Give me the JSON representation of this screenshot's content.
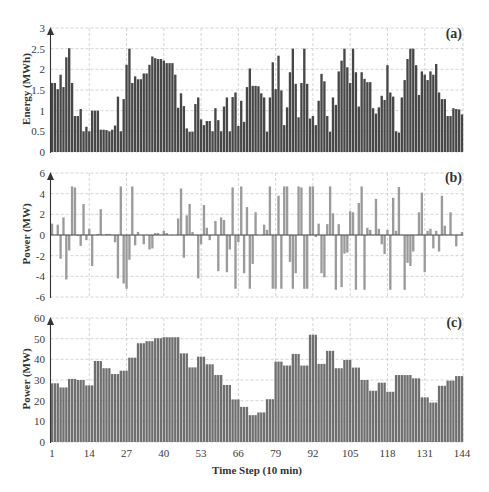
{
  "figure": {
    "x_axis_title": "Time Step (10 min)",
    "x_ticks": [
      "1",
      "14",
      "27",
      "40",
      "53",
      "66",
      "79",
      "92",
      "105",
      "118",
      "131",
      "144"
    ]
  },
  "colors": {
    "energy_bars": "#474747",
    "power_bars": "#9b9b9b",
    "load_bars": "#6f6f6f",
    "grid": "#c9c9c9",
    "axis": "#333333"
  },
  "chart_data": [
    {
      "type": "bar",
      "panel_label": "(a)",
      "title": "",
      "xlabel": "Time Step (10 min)",
      "ylabel": "Energy (MWh)",
      "x_start": 1,
      "x_end": 144,
      "x_ticks": [
        1,
        14,
        27,
        40,
        53,
        66,
        79,
        92,
        105,
        118,
        131,
        144
      ],
      "y_ticks": [
        "0",
        "0.5",
        "1",
        "1.5",
        "2",
        "2.5",
        "3"
      ],
      "ylim": [
        0,
        3
      ],
      "grid": true,
      "legend": null,
      "series": [
        {
          "name": "Energy",
          "values": [
            1.67,
            1.67,
            1.52,
            1.87,
            1.57,
            2.29,
            2.51,
            1.67,
            0.87,
            0.87,
            1.04,
            0.5,
            0.61,
            0.5,
            1.0,
            1.0,
            1.0,
            0.54,
            0.54,
            0.53,
            0.5,
            0.54,
            0.64,
            1.34,
            0.5,
            1.28,
            2.11,
            2.5,
            1.67,
            1.83,
            1.76,
            1.76,
            1.9,
            1.9,
            2.11,
            2.31,
            2.27,
            2.25,
            2.25,
            2.21,
            2.15,
            2.15,
            2.15,
            1.87,
            1.07,
            1.42,
            1.11,
            0.57,
            0.49,
            0.49,
            1.16,
            1.32,
            0.79,
            0.65,
            0.75,
            0.75,
            0.5,
            1.06,
            0.77,
            0.5,
            1.1,
            1.32,
            0.5,
            1.33,
            1.44,
            0.63,
            1.24,
            0.73,
            1.57,
            2.02,
            1.6,
            1.6,
            1.59,
            1.42,
            1.32,
            0.49,
            1.32,
            2.17,
            1.52,
            2.33,
            1.49,
            0.65,
            1.08,
            1.93,
            2.5,
            1.65,
            0.84,
            1.67,
            2.5,
            1.65,
            0.81,
            0.87,
            0.65,
            1.24,
            1.89,
            1.71,
            0.87,
            0.49,
            1.32,
            1.14,
            1.95,
            2.21,
            2.5,
            2.05,
            1.67,
            2.5,
            1.93,
            1.1,
            1.93,
            1.77,
            1.69,
            1.69,
            1.06,
            0.93,
            1.08,
            1.36,
            1.26,
            2.1,
            1.44,
            1.34,
            0.5,
            0.47,
            1.32,
            1.74,
            2.25,
            2.5,
            2.5,
            2.1,
            1.38,
            1.95,
            1.87,
            1.74,
            1.95,
            1.87,
            2.13,
            1.44,
            1.28,
            1.28,
            0.87,
            0.87,
            1.06,
            1.04,
            1.03,
            0.91
          ]
        }
      ]
    },
    {
      "type": "bar",
      "panel_label": "(b)",
      "title": "",
      "xlabel": "Time Step (10 min)",
      "ylabel": "Power (MW)",
      "x_start": 1,
      "x_end": 144,
      "x_ticks": [
        1,
        14,
        27,
        40,
        53,
        66,
        79,
        92,
        105,
        118,
        131,
        144
      ],
      "y_ticks": [
        "-6",
        "-4",
        "-2",
        "0",
        "2",
        "4",
        "6"
      ],
      "ylim": [
        -6,
        6
      ],
      "grid": true,
      "legend": null,
      "series": [
        {
          "name": "Power",
          "values": [
            1.1,
            0,
            1.0,
            -2.3,
            1.7,
            -4.3,
            -1.5,
            4.7,
            4.6,
            -0.1,
            -1.05,
            3.0,
            -0.5,
            0.6,
            -3.0,
            0,
            0.1,
            2.5,
            0,
            0.1,
            0.1,
            0,
            -0.7,
            -4.2,
            4.7,
            -4.7,
            -5.2,
            -2.4,
            4.7,
            -1.0,
            0.3,
            0,
            -0.9,
            0,
            -1.4,
            -1.3,
            0.2,
            0.2,
            0,
            0.4,
            0.2,
            0,
            0,
            0,
            1.6,
            4.5,
            -2.2,
            1.9,
            3.0,
            0.3,
            0,
            -4.2,
            -0.9,
            2.9,
            0.7,
            -0.5,
            0,
            1.35,
            -3.5,
            1.7,
            1.45,
            -3.6,
            -1.4,
            4.6,
            -5.2,
            -0.7,
            4.7,
            -3.7,
            2.7,
            -5.2,
            -2.8,
            2.2,
            0,
            0,
            1.0,
            0.5,
            4.7,
            -5.2,
            -5.2,
            3.8,
            -5.2,
            4.7,
            4.7,
            -2.6,
            -5.2,
            -3.7,
            4.7,
            4.6,
            -5.2,
            -5.2,
            4.7,
            4.7,
            -0.2,
            1.1,
            -3.7,
            -4.1,
            1.05,
            4.7,
            2.1,
            -5.3,
            1.05,
            -5.05,
            -1.8,
            -1.7,
            2.3,
            2.2,
            -5.3,
            3.1,
            4.7,
            -5.3,
            0.7,
            0.5,
            0,
            3.5,
            0.6,
            -0.9,
            -1.85,
            0.5,
            -5.3,
            3.6,
            0.4,
            4.65,
            0,
            -5.3,
            -2.7,
            -3.0,
            -1.6,
            0,
            2.2,
            4.1,
            -3.6,
            0.4,
            0.6,
            -1.3,
            0.4,
            -1.6,
            3.8,
            0.9,
            0,
            2.2,
            0,
            -1.1,
            0,
            0.3
          ]
        }
      ]
    },
    {
      "type": "bar",
      "panel_label": "(c)",
      "title": "",
      "xlabel": "Time Step (10 min)",
      "ylabel": "Power (MW)",
      "x_start": 1,
      "x_end": 144,
      "x_ticks": [
        1,
        14,
        27,
        40,
        53,
        66,
        79,
        92,
        105,
        118,
        131,
        144
      ],
      "y_ticks": [
        "0",
        "10",
        "20",
        "30",
        "40",
        "50",
        "60"
      ],
      "ylim": [
        0,
        60
      ],
      "grid": true,
      "legend": null,
      "series": [
        {
          "name": "Power",
          "values": [
            28.4,
            28.4,
            28.4,
            26.4,
            26.4,
            26.4,
            30.5,
            30.5,
            30.5,
            30.0,
            30.0,
            30.0,
            27.4,
            27.4,
            27.4,
            39.2,
            39.2,
            39.2,
            35.7,
            35.7,
            35.7,
            32.9,
            32.9,
            32.9,
            34.5,
            34.5,
            34.5,
            40.8,
            40.8,
            40.8,
            47.8,
            47.8,
            47.8,
            48.8,
            48.8,
            48.8,
            50.2,
            50.2,
            50.2,
            50.7,
            50.7,
            50.7,
            50.7,
            50.7,
            50.7,
            42.9,
            42.9,
            42.9,
            36.1,
            36.1,
            36.1,
            41.3,
            41.3,
            41.3,
            37.6,
            37.6,
            37.6,
            32.4,
            32.4,
            32.4,
            27.6,
            27.6,
            27.6,
            20.6,
            20.6,
            20.6,
            17.0,
            17.0,
            17.0,
            13.0,
            13.0,
            13.0,
            14.3,
            14.3,
            14.3,
            20.7,
            20.7,
            20.7,
            38.9,
            38.9,
            38.9,
            37.0,
            37.0,
            37.0,
            42.6,
            42.6,
            42.6,
            37.0,
            37.0,
            37.0,
            51.9,
            51.9,
            51.9,
            37.8,
            37.8,
            37.8,
            44.1,
            44.1,
            44.1,
            35.7,
            35.7,
            35.7,
            39.7,
            39.7,
            39.7,
            36.0,
            36.0,
            36.0,
            30.0,
            30.0,
            30.0,
            24.8,
            24.8,
            24.8,
            28.7,
            28.7,
            28.7,
            24.3,
            24.3,
            24.3,
            32.4,
            32.4,
            32.4,
            32.4,
            32.4,
            32.4,
            30.8,
            30.8,
            30.8,
            21.6,
            21.6,
            21.6,
            19.1,
            19.1,
            19.1,
            27.2,
            27.2,
            27.2,
            29.7,
            29.7,
            29.7,
            31.9,
            31.9,
            31.9
          ]
        }
      ]
    }
  ]
}
